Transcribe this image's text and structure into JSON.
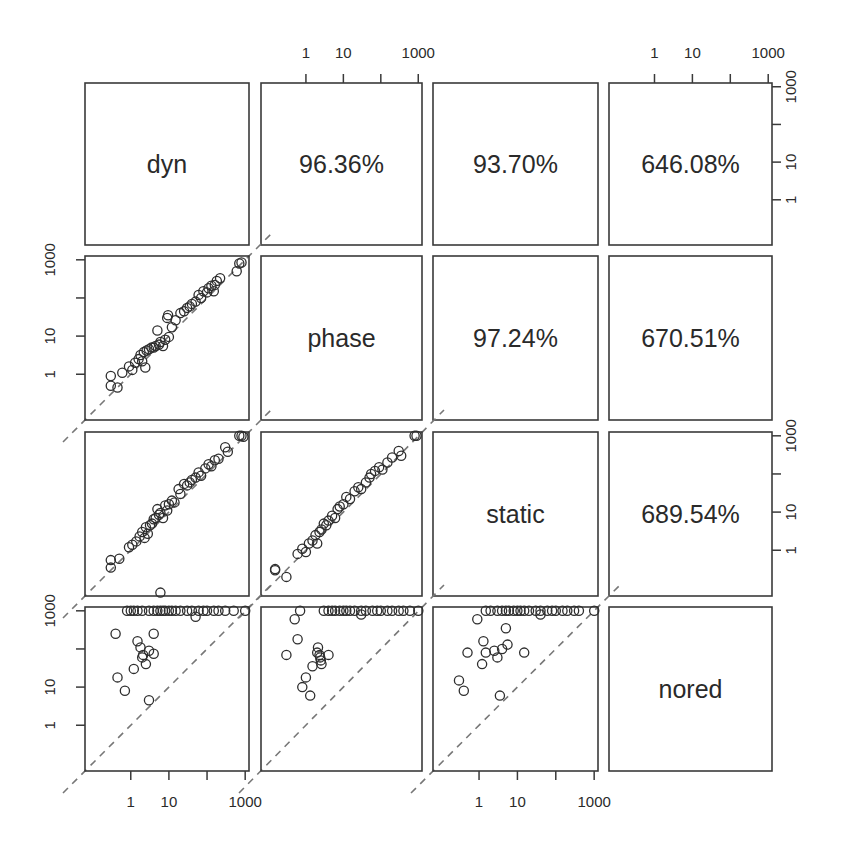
{
  "chart_data": {
    "type": "scatter",
    "subtype": "scatterplot-matrix",
    "title": "",
    "variables": [
      "dyn",
      "phase",
      "static",
      "nored"
    ],
    "scale": "log10",
    "axis_ticks": [
      1,
      10,
      1000
    ],
    "axis_tick_positions": [
      1,
      10,
      100,
      1000
    ],
    "axis_range_log10": [
      -1.2,
      3.1
    ],
    "reference_line": "y = x (dashed grey)",
    "grid": false,
    "upper_panels": [
      {
        "row": "dyn",
        "col": "phase",
        "label": "96.36%"
      },
      {
        "row": "dyn",
        "col": "static",
        "label": "93.70%"
      },
      {
        "row": "dyn",
        "col": "nored",
        "label": "646.08%"
      },
      {
        "row": "phase",
        "col": "static",
        "label": "97.24%"
      },
      {
        "row": "phase",
        "col": "nored",
        "label": "670.51%"
      },
      {
        "row": "static",
        "col": "nored",
        "label": "689.54%"
      }
    ],
    "top_axis": {
      "columns": [
        "phase",
        "nored"
      ],
      "labels": [
        "1",
        "10",
        "1000"
      ]
    },
    "right_axis": {
      "rows": [
        "dyn",
        "static"
      ],
      "labels": [
        "1",
        "10",
        "1000"
      ]
    },
    "left_axis": {
      "rows": [
        "phase",
        "nored"
      ],
      "labels": [
        "1",
        "10",
        "1000"
      ]
    },
    "bottom_axis": {
      "columns": [
        "dyn",
        "static"
      ],
      "labels": [
        "1",
        "10",
        "1000"
      ]
    },
    "lower_panels": [
      {
        "x": "dyn",
        "y": "phase",
        "points": [
          [
            0.3,
            0.5
          ],
          [
            0.3,
            0.9
          ],
          [
            0.45,
            0.45
          ],
          [
            0.6,
            1.1
          ],
          [
            0.9,
            1.6
          ],
          [
            1.1,
            1.3
          ],
          [
            1.3,
            2.0
          ],
          [
            1.6,
            2.5
          ],
          [
            1.8,
            3.2
          ],
          [
            2.0,
            2.2
          ],
          [
            2.2,
            3.8
          ],
          [
            2.4,
            1.5
          ],
          [
            2.6,
            4.2
          ],
          [
            3.0,
            4.5
          ],
          [
            3.5,
            5.0
          ],
          [
            4.0,
            5.0
          ],
          [
            4.5,
            5.5
          ],
          [
            5.0,
            14
          ],
          [
            5.5,
            6.0
          ],
          [
            6.0,
            7.0
          ],
          [
            7.0,
            5.5
          ],
          [
            8.0,
            8.0
          ],
          [
            9.0,
            30
          ],
          [
            9.5,
            35
          ],
          [
            10,
            9.5
          ],
          [
            12,
            17
          ],
          [
            15,
            26
          ],
          [
            20,
            40
          ],
          [
            25,
            45
          ],
          [
            30,
            55
          ],
          [
            35,
            60
          ],
          [
            40,
            70
          ],
          [
            50,
            80
          ],
          [
            60,
            120
          ],
          [
            70,
            100
          ],
          [
            80,
            150
          ],
          [
            100,
            140
          ],
          [
            110,
            180
          ],
          [
            130,
            210
          ],
          [
            150,
            150
          ],
          [
            160,
            220
          ],
          [
            180,
            280
          ],
          [
            220,
            330
          ],
          [
            600,
            500
          ],
          [
            700,
            800
          ],
          [
            800,
            850
          ]
        ]
      },
      {
        "x": "dyn",
        "y": "static",
        "points": [
          [
            0.3,
            0.35
          ],
          [
            0.3,
            0.55
          ],
          [
            0.5,
            0.6
          ],
          [
            0.9,
            1.2
          ],
          [
            1.1,
            1.4
          ],
          [
            1.4,
            1.7
          ],
          [
            1.7,
            2.3
          ],
          [
            2.0,
            3.0
          ],
          [
            2.3,
            2.1
          ],
          [
            2.5,
            4.0
          ],
          [
            2.8,
            2.7
          ],
          [
            3.2,
            4.5
          ],
          [
            3.6,
            5.0
          ],
          [
            4.0,
            6.5
          ],
          [
            4.5,
            7.0
          ],
          [
            5.0,
            12
          ],
          [
            5.5,
            8.5
          ],
          [
            6.0,
            9.5
          ],
          [
            7.0,
            7.0
          ],
          [
            8.0,
            15
          ],
          [
            9.0,
            11
          ],
          [
            10,
            16
          ],
          [
            12,
            20
          ],
          [
            14,
            18
          ],
          [
            18,
            40
          ],
          [
            20,
            30
          ],
          [
            25,
            55
          ],
          [
            30,
            50
          ],
          [
            35,
            60
          ],
          [
            40,
            70
          ],
          [
            50,
            80
          ],
          [
            60,
            110
          ],
          [
            70,
            90
          ],
          [
            90,
            140
          ],
          [
            110,
            180
          ],
          [
            130,
            160
          ],
          [
            160,
            230
          ],
          [
            200,
            250
          ],
          [
            300,
            500
          ],
          [
            350,
            380
          ],
          [
            700,
            1000
          ],
          [
            800,
            1000
          ],
          [
            900,
            950
          ]
        ]
      },
      {
        "x": "phase",
        "y": "static",
        "points": [
          [
            0.15,
            0.3
          ],
          [
            0.15,
            0.32
          ],
          [
            0.3,
            0.2
          ],
          [
            0.6,
            0.8
          ],
          [
            0.8,
            1.1
          ],
          [
            1.0,
            0.9
          ],
          [
            1.2,
            1.5
          ],
          [
            1.5,
            1.8
          ],
          [
            1.8,
            2.5
          ],
          [
            2.0,
            1.5
          ],
          [
            2.3,
            3.0
          ],
          [
            2.6,
            3.5
          ],
          [
            3.0,
            5.0
          ],
          [
            3.5,
            4.5
          ],
          [
            4.0,
            6.0
          ],
          [
            5.0,
            8.0
          ],
          [
            6.0,
            7.0
          ],
          [
            7.0,
            12
          ],
          [
            8.0,
            14
          ],
          [
            10,
            16
          ],
          [
            12,
            25
          ],
          [
            15,
            22
          ],
          [
            20,
            35
          ],
          [
            25,
            45
          ],
          [
            30,
            40
          ],
          [
            40,
            60
          ],
          [
            50,
            80
          ],
          [
            55,
            100
          ],
          [
            70,
            120
          ],
          [
            90,
            150
          ],
          [
            110,
            130
          ],
          [
            150,
            200
          ],
          [
            200,
            270
          ],
          [
            300,
            400
          ],
          [
            350,
            300
          ],
          [
            800,
            1000
          ],
          [
            900,
            1000
          ]
        ]
      },
      {
        "x": "dyn",
        "y": "nored",
        "points": [
          [
            0.4,
            250
          ],
          [
            0.45,
            18
          ],
          [
            0.7,
            8
          ],
          [
            1.2,
            30
          ],
          [
            1.5,
            160
          ],
          [
            1.8,
            110
          ],
          [
            2.0,
            60
          ],
          [
            2.1,
            70
          ],
          [
            2.5,
            40
          ],
          [
            3.0,
            4.5
          ],
          [
            3.0,
            90
          ],
          [
            4.0,
            250
          ],
          [
            4.0,
            75
          ],
          [
            6.0,
            3000
          ],
          [
            1000,
            1000
          ],
          [
            500,
            1000
          ],
          [
            300,
            1000
          ],
          [
            200,
            1000
          ],
          [
            150,
            1000
          ],
          [
            100,
            1000
          ],
          [
            80,
            1000
          ],
          [
            60,
            1000
          ],
          [
            40,
            1000
          ],
          [
            30,
            1000
          ],
          [
            20,
            1000
          ],
          [
            15,
            1000
          ],
          [
            12,
            1000
          ],
          [
            10,
            1000
          ],
          [
            8,
            1000
          ],
          [
            7,
            1000
          ],
          [
            6,
            1000
          ],
          [
            5,
            1000
          ],
          [
            4,
            1000
          ],
          [
            3,
            1000
          ],
          [
            2,
            1000
          ],
          [
            1.5,
            1000
          ],
          [
            1.2,
            1000
          ],
          [
            1.0,
            1000
          ],
          [
            0.8,
            1000
          ],
          [
            50,
            700
          ]
        ]
      },
      {
        "x": "phase",
        "y": "nored",
        "points": [
          [
            0.3,
            70
          ],
          [
            0.5,
            600
          ],
          [
            0.6,
            180
          ],
          [
            0.8,
            10
          ],
          [
            1.0,
            18
          ],
          [
            1.3,
            6
          ],
          [
            1.5,
            35
          ],
          [
            2.0,
            80
          ],
          [
            2.1,
            110
          ],
          [
            2.3,
            70
          ],
          [
            2.4,
            60
          ],
          [
            2.5,
            50
          ],
          [
            2.6,
            40
          ],
          [
            4.0,
            70
          ],
          [
            1000,
            1000
          ],
          [
            600,
            1000
          ],
          [
            400,
            1000
          ],
          [
            300,
            1000
          ],
          [
            200,
            1000
          ],
          [
            150,
            1000
          ],
          [
            100,
            1000
          ],
          [
            80,
            1000
          ],
          [
            60,
            1000
          ],
          [
            40,
            1000
          ],
          [
            30,
            1000
          ],
          [
            20,
            1000
          ],
          [
            15,
            1000
          ],
          [
            12,
            1000
          ],
          [
            10,
            1000
          ],
          [
            8,
            1000
          ],
          [
            6,
            1000
          ],
          [
            5,
            1000
          ],
          [
            4,
            1000
          ],
          [
            3,
            1000
          ],
          [
            0.7,
            1000
          ],
          [
            30,
            800
          ]
        ]
      },
      {
        "x": "static",
        "y": "nored",
        "points": [
          [
            0.3,
            15
          ],
          [
            0.4,
            8
          ],
          [
            0.5,
            80
          ],
          [
            0.9,
            600
          ],
          [
            1.2,
            40
          ],
          [
            1.3,
            160
          ],
          [
            1.5,
            80
          ],
          [
            2.5,
            90
          ],
          [
            3.0,
            60
          ],
          [
            3.5,
            6
          ],
          [
            4.0,
            100
          ],
          [
            5.0,
            350
          ],
          [
            5.5,
            130
          ],
          [
            15,
            80
          ],
          [
            1000,
            1000
          ],
          [
            400,
            1000
          ],
          [
            300,
            1000
          ],
          [
            200,
            1000
          ],
          [
            150,
            1000
          ],
          [
            100,
            1000
          ],
          [
            80,
            1000
          ],
          [
            60,
            1000
          ],
          [
            40,
            1000
          ],
          [
            30,
            1000
          ],
          [
            20,
            1000
          ],
          [
            15,
            1000
          ],
          [
            12,
            1000
          ],
          [
            10,
            1000
          ],
          [
            8,
            1000
          ],
          [
            6,
            1000
          ],
          [
            5,
            1000
          ],
          [
            4,
            1000
          ],
          [
            3,
            1000
          ],
          [
            2,
            1000
          ],
          [
            1.5,
            1000
          ],
          [
            40,
            800
          ]
        ]
      }
    ]
  }
}
